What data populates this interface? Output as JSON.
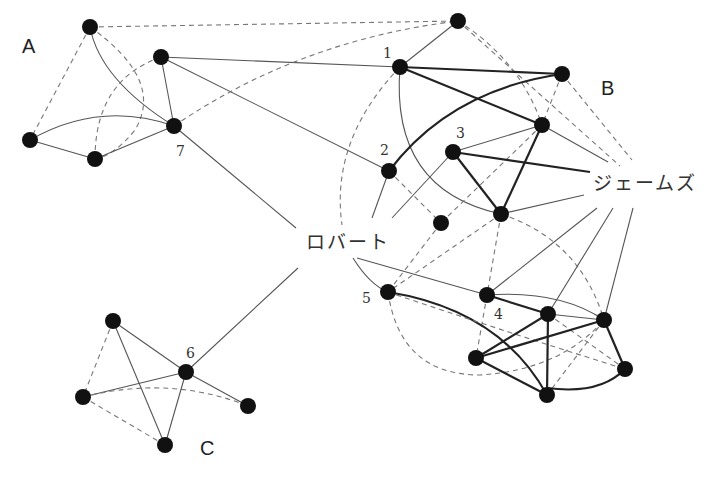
{
  "diagram": {
    "type": "social-network-graph",
    "clusters": [
      {
        "id": "A",
        "label": "A",
        "x": 22,
        "y": 53
      },
      {
        "id": "B",
        "label": "B",
        "x": 601,
        "y": 95
      },
      {
        "id": "C",
        "label": "C",
        "x": 200,
        "y": 455
      }
    ],
    "people": [
      {
        "id": "robert",
        "label": "ロバート",
        "x": 306,
        "y": 249
      },
      {
        "id": "james",
        "label": "ジェームズ",
        "x": 593,
        "y": 190
      }
    ],
    "node_labels": [
      {
        "label": "1",
        "x": 383,
        "y": 58
      },
      {
        "label": "2",
        "x": 380,
        "y": 155
      },
      {
        "label": "3",
        "x": 456,
        "y": 138
      },
      {
        "label": "4",
        "x": 494,
        "y": 319
      },
      {
        "label": "5",
        "x": 362,
        "y": 303
      },
      {
        "label": "6",
        "x": 186,
        "y": 358
      },
      {
        "label": "7",
        "x": 176,
        "y": 156
      }
    ],
    "edge_legend": {
      "solid_strong": "strong tie",
      "solid": "tie",
      "dashed": "weak tie"
    },
    "colors": {
      "node": "#111111",
      "strong_edge": "#222222",
      "edge": "#555555",
      "dashed_edge": "#777777",
      "background": "#ffffff"
    }
  }
}
